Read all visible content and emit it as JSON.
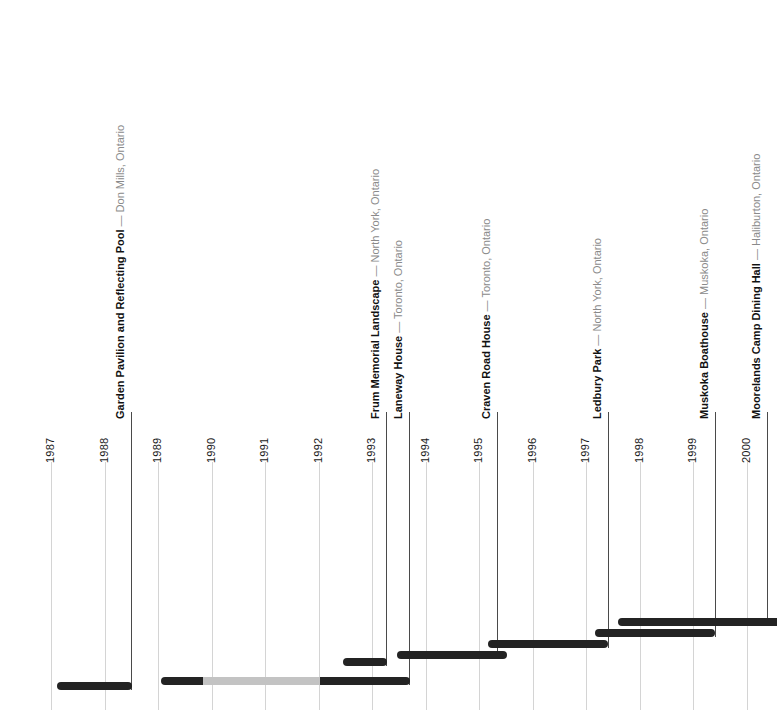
{
  "chart_data": {
    "type": "bar",
    "title": "",
    "subtitle": "",
    "xlabel": "",
    "ylabel": "",
    "orientation": "horizontal-timeline",
    "grid": true,
    "legend": "none",
    "xlim": [
      1986.5,
      2000.9
    ],
    "x_tick_labels": [
      "1987",
      "1988",
      "1989",
      "1990",
      "1991",
      "1992",
      "1993",
      "1994",
      "1995",
      "1996",
      "1997",
      "1998",
      "1999",
      "2000"
    ],
    "x_tick_values": [
      1987,
      1988,
      1989,
      1990,
      1991,
      1992,
      1993,
      1994,
      1995,
      1996,
      1997,
      1998,
      1999,
      2000
    ],
    "categories": [
      "Garden Pavilion and Reflecting Pool",
      "Laneway House",
      "Frum Memorial Landscape",
      "Craven Road House",
      "Ledbury Park",
      "Muskoka Boathouse",
      "Moorelands Camp Dining Hall"
    ],
    "series": [
      {
        "name": "Project duration",
        "values": [
          {
            "label": "Garden Pavilion and Reflecting Pool",
            "start": 1987.1,
            "end": 1988.6
          },
          {
            "label": "Laneway House",
            "start": 1989.1,
            "end": 1993.8
          },
          {
            "label": "Frum Memorial Landscape",
            "start": 1992.5,
            "end": 1993.3
          },
          {
            "label": "Craven Road House",
            "start": 1993.5,
            "end": 1995.6
          },
          {
            "label": "Ledbury Park",
            "start": 1995.2,
            "end": 1997.4
          },
          {
            "label": "Muskoka Boathouse",
            "start": 1997.2,
            "end": 1999.5
          },
          {
            "label": "Moorelands Camp Dining Hall",
            "start": 1997.6,
            "end": 2000.9
          }
        ]
      }
    ]
  },
  "axis": {
    "years": [
      {
        "label": "1987",
        "x": 51
      },
      {
        "label": "1988",
        "x": 104.5
      },
      {
        "label": "1989",
        "x": 158
      },
      {
        "label": "1990",
        "x": 211.5
      },
      {
        "label": "1991",
        "x": 265
      },
      {
        "label": "1992",
        "x": 318.5
      },
      {
        "label": "1993",
        "x": 372
      },
      {
        "label": "1994",
        "x": 425.5
      },
      {
        "label": "1995",
        "x": 479
      },
      {
        "label": "1996",
        "x": 532.5
      },
      {
        "label": "1997",
        "x": 586
      },
      {
        "label": "1998",
        "x": 639.5
      },
      {
        "label": "1999",
        "x": 693
      },
      {
        "label": "2000",
        "x": 746.5
      }
    ]
  },
  "projects": [
    {
      "id": "garden-pavilion",
      "name": "Garden Pavilion and Reflecting Pool",
      "dash": "—",
      "location": "Don Mills, Ontario",
      "label_x": 126,
      "label_bottom": 408,
      "leader_x": 131,
      "leader_top": 412,
      "leader_bottom": 690,
      "bar_y": 682,
      "segments": [
        {
          "x": 57,
          "w": 75,
          "tone": "dark",
          "cap": "both"
        }
      ]
    },
    {
      "id": "laneway-house",
      "name": "Laneway House",
      "dash": "—",
      "location": "Toronto, Ontario",
      "label_x": 404,
      "label_bottom": 408,
      "leader_x": 409,
      "leader_top": 412,
      "leader_bottom": 685,
      "bar_y": 677,
      "segments": [
        {
          "x": 161,
          "w": 42,
          "tone": "dark",
          "cap": "left"
        },
        {
          "x": 203,
          "w": 117,
          "tone": "light",
          "cap": "none"
        },
        {
          "x": 320,
          "w": 90,
          "tone": "dark",
          "cap": "right"
        }
      ]
    },
    {
      "id": "frum-memorial",
      "name": "Frum Memorial Landscape",
      "dash": "—",
      "location": "North York, Ontario",
      "label_x": 381,
      "label_bottom": 408,
      "leader_x": 386,
      "leader_top": 412,
      "leader_bottom": 666,
      "bar_y": 658,
      "segments": [
        {
          "x": 343,
          "w": 44,
          "tone": "dark",
          "cap": "both"
        }
      ]
    },
    {
      "id": "craven-road-house",
      "name": "Craven Road House",
      "dash": "—",
      "location": "Toronto, Ontario",
      "label_x": 492,
      "label_bottom": 408,
      "leader_x": 497,
      "leader_top": 412,
      "leader_bottom": 659,
      "bar_y": 651,
      "segments": [
        {
          "x": 397,
          "w": 110,
          "tone": "dark",
          "cap": "both"
        }
      ]
    },
    {
      "id": "ledbury-park",
      "name": "Ledbury Park",
      "dash": "—",
      "location": "North York, Ontario",
      "label_x": 603,
      "label_bottom": 408,
      "leader_x": 608,
      "leader_top": 412,
      "leader_bottom": 648,
      "bar_y": 640,
      "segments": [
        {
          "x": 488,
          "w": 120,
          "tone": "dark",
          "cap": "both"
        }
      ]
    },
    {
      "id": "muskoka-boathouse",
      "name": "Muskoka Boathouse",
      "dash": "—",
      "location": "Muskoka, Ontario",
      "label_x": 710,
      "label_bottom": 408,
      "leader_x": 715,
      "leader_top": 412,
      "leader_bottom": 637,
      "bar_y": 629,
      "segments": [
        {
          "x": 595,
          "w": 120,
          "tone": "dark",
          "cap": "both"
        }
      ]
    },
    {
      "id": "moorelands-camp",
      "name": "Moorelands Camp Dining Hall",
      "dash": "—",
      "location": "Haliburton, Ontario",
      "label_x": 762,
      "label_bottom": 408,
      "leader_x": 767,
      "leader_top": 412,
      "leader_bottom": 626,
      "bar_y": 618,
      "segments": [
        {
          "x": 618,
          "w": 159,
          "tone": "dark",
          "cap": "left"
        }
      ]
    }
  ],
  "colors": {
    "bar_dark": "#232323",
    "bar_light": "#c3c3c3",
    "gridline": "#d4d4d4",
    "leader": "#4a4a4a",
    "text_primary": "#111111",
    "text_secondary": "#8a8a8a",
    "background": "#ffffff"
  }
}
